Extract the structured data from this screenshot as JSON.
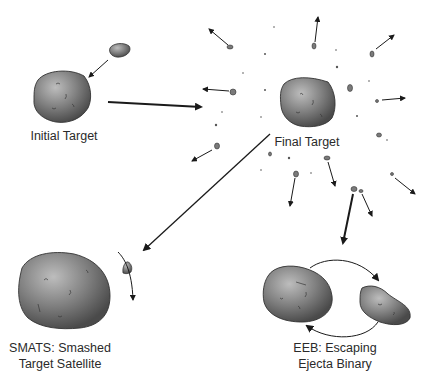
{
  "labels": {
    "initial_target": "Initial Target",
    "final_target": "Final Target",
    "smats_line1": "SMATS: Smashed",
    "smats_line2": "Target Satellite",
    "eeb_line1": "EEB: Escaping",
    "eeb_line2": "Ejecta Binary"
  },
  "colors": {
    "asteroid_dark": "#4a4a4a",
    "asteroid_mid": "#8a8a8a",
    "asteroid_light": "#b5b5b5",
    "arrow": "#1a1a1a",
    "background": "#ffffff"
  }
}
